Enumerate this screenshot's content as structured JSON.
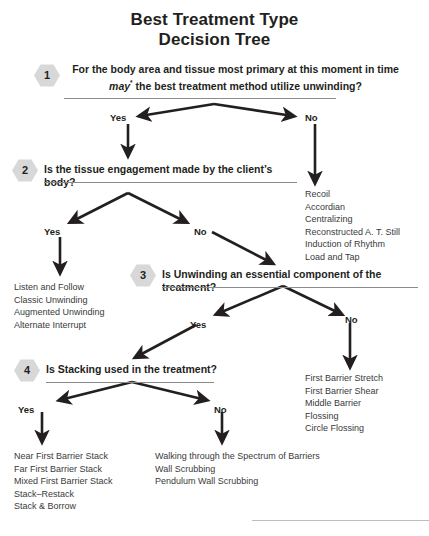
{
  "title": {
    "line1": "Best Treatment Type",
    "line2": "Decision Tree"
  },
  "nodes": [
    {
      "number": "1",
      "question_line1": "For the body area and tissue most primary at this moment in time",
      "question_line2_pre": "may",
      "question_line2_sup": "*",
      "question_line2_post": " the best treatment method utilize unwinding?",
      "yes_label": "Yes",
      "no_label": "No"
    },
    {
      "number": "2",
      "question": "Is the tissue engagement made by the client’s body?",
      "yes_label": "Yes",
      "no_label": "No"
    },
    {
      "number": "3",
      "question": "Is Unwinding an essential component of the treatment?",
      "yes_label": "Yes",
      "no_label": "No"
    },
    {
      "number": "4",
      "question": "Is Stacking used in the treatment?",
      "yes_label": "Yes",
      "no_label": "No"
    }
  ],
  "outcomes": {
    "node1_no": [
      "Recoil",
      "Accordian",
      "Centralizing",
      "Reconstructed A. T. Still",
      "Induction of Rhythm",
      "Load and Tap"
    ],
    "node2_yes": [
      "Listen and Follow",
      "Classic Unwinding",
      "Augmented Unwinding",
      "Alternate Interrupt"
    ],
    "node3_no": [
      "First Barrier Stretch",
      "First Barrier Shear",
      "Middle Barrier",
      "Flossing",
      "Circle Flossing"
    ],
    "node4_yes": [
      "Near First Barrier Stack",
      "Far First Barrier Stack",
      "Mixed First Barrier Stack",
      "Stack–Restack",
      "Stack & Borrow"
    ],
    "node4_no": [
      "Walking through the Spectrum of Barriers",
      "Wall Scrubbing",
      "Pendulum Wall Scrubbing"
    ]
  },
  "colors": {
    "text": "#231f20",
    "list_text": "#3a3a3a",
    "badge_fill": "#d8d8d8",
    "rule": "#8b8b8b",
    "arrow": "#231f20",
    "background": "#ffffff"
  }
}
